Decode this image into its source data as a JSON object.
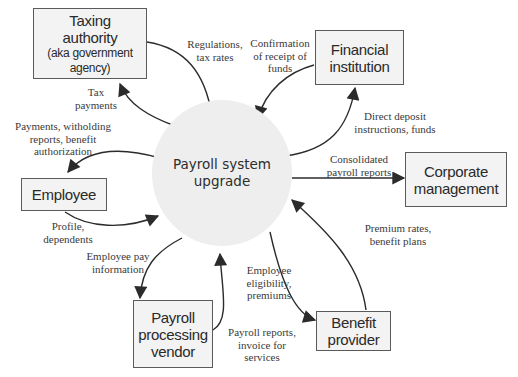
{
  "diagram": {
    "type": "context-diagram",
    "center": {
      "line1": "Payroll system",
      "line2": "upgrade"
    },
    "entities": {
      "taxing_authority": {
        "line1": "Taxing",
        "line2": "authority",
        "sub": "(aka government agency)"
      },
      "financial_institution": {
        "line1": "Financial",
        "line2": "institution"
      },
      "employee": {
        "line1": "Employee"
      },
      "corporate_management": {
        "line1": "Corporate",
        "line2": "management"
      },
      "benefit_provider": {
        "line1": "Benefit",
        "line2": "provider"
      },
      "payroll_vendor": {
        "line1": "Payroll",
        "line2": "processing",
        "line3": "vendor"
      }
    },
    "flows": {
      "regulations": {
        "line1": "Regulations,",
        "line2": "tax rates"
      },
      "tax_payments": {
        "line1": "Tax",
        "line2": "payments"
      },
      "confirmation": {
        "line1": "Confirmation",
        "line2": "of receipt of",
        "line3": "funds"
      },
      "direct_deposit": {
        "line1": "Direct deposit",
        "line2": "instructions, funds"
      },
      "payments_withholding": {
        "line1": "Payments, witholding",
        "line2": "reports, benefit",
        "line3": "authorization"
      },
      "profile": {
        "line1": "Profile,",
        "line2": "dependents"
      },
      "consolidated": {
        "line1": "Consolidated",
        "line2": "payroll reports"
      },
      "premium_rates": {
        "line1": "Premium rates,",
        "line2": "benefit plans"
      },
      "employee_eligibility": {
        "line1": "Employee",
        "line2": "eligibility,",
        "line3": "premiums"
      },
      "employee_pay": {
        "line1": "Employee pay",
        "line2": "information"
      },
      "payroll_reports": {
        "line1": "Payroll reports,",
        "line2": "invoice for",
        "line3": "services"
      }
    },
    "colors": {
      "box_fill": "#f3f3f3",
      "box_border": "#5a5a5a",
      "circle_fill": "#eeeeee",
      "arrow": "#2b2b2b",
      "text": "#2a2a2a"
    }
  }
}
